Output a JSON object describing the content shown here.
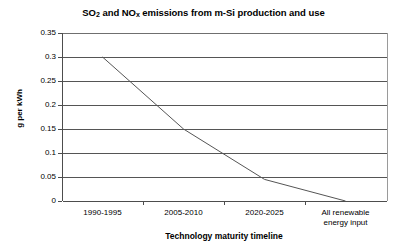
{
  "chart_data": {
    "type": "line",
    "title": "SO2 and NOx emissions from m-Si production and use",
    "title_parts": {
      "so": "SO",
      "so_sub": "2",
      "mid": " and NO",
      "nox_sub": "x",
      "tail": " emissions from m-Si production and use"
    },
    "xlabel": "Technology maturity timeline",
    "ylabel": "g per kWh",
    "categories": [
      "1990-1995",
      "2005-2010",
      "2020-2025",
      "All renewable\nenergy input"
    ],
    "values": [
      0.3,
      0.15,
      0.045,
      0
    ],
    "series": [
      {
        "name": "SO2 and NOx emissions",
        "values": [
          0.3,
          0.15,
          0.045,
          0
        ]
      }
    ],
    "ylim": [
      0,
      0.35
    ],
    "ytick_labels": [
      "0.35",
      "0.3",
      "0.25",
      "0.2",
      "0.15",
      "0.1",
      "0.05",
      "0"
    ],
    "ytick_values": [
      0.35,
      0.3,
      0.25,
      0.2,
      0.15,
      0.1,
      0.05,
      0
    ],
    "grid": true,
    "legend": "none",
    "line_color": "#555555",
    "axis_color": "#4d4d4d",
    "background": "#ffffff"
  }
}
